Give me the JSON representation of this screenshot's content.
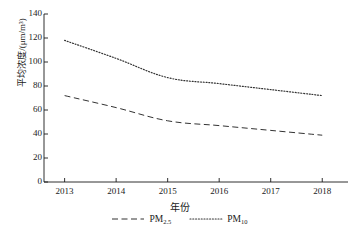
{
  "chart_data": {
    "type": "line",
    "title": "",
    "subtitle": "",
    "xlabel": "年份",
    "ylabel": "平均浓度/(μm/m³)",
    "x": [
      2013,
      2014,
      2015,
      2016,
      2017,
      2018
    ],
    "xticklabels": [
      "2013",
      "2014",
      "2015",
      "2016",
      "2017",
      "2018"
    ],
    "yticklabels": [
      "0",
      "20",
      "40",
      "60",
      "80",
      "100",
      "120",
      "140"
    ],
    "yticks": [
      0,
      20,
      40,
      60,
      80,
      100,
      120,
      140
    ],
    "ylim": [
      0,
      140
    ],
    "xlim": [
      2012.6,
      2018.5
    ],
    "grid": false,
    "legend_position": "below",
    "series": [
      {
        "name": "PM2.5",
        "label_main": "PM",
        "label_sub": "2.5",
        "linestyle": "dashed",
        "color": "#333333",
        "values": [
          72,
          62,
          51,
          47,
          43,
          39
        ]
      },
      {
        "name": "PM10",
        "label_main": "PM",
        "label_sub": "10",
        "linestyle": "dotted",
        "color": "#333333",
        "values": [
          118,
          103,
          87,
          82,
          77,
          72
        ]
      }
    ],
    "axis_color": "#1a1a1a",
    "background": "#ffffff"
  }
}
